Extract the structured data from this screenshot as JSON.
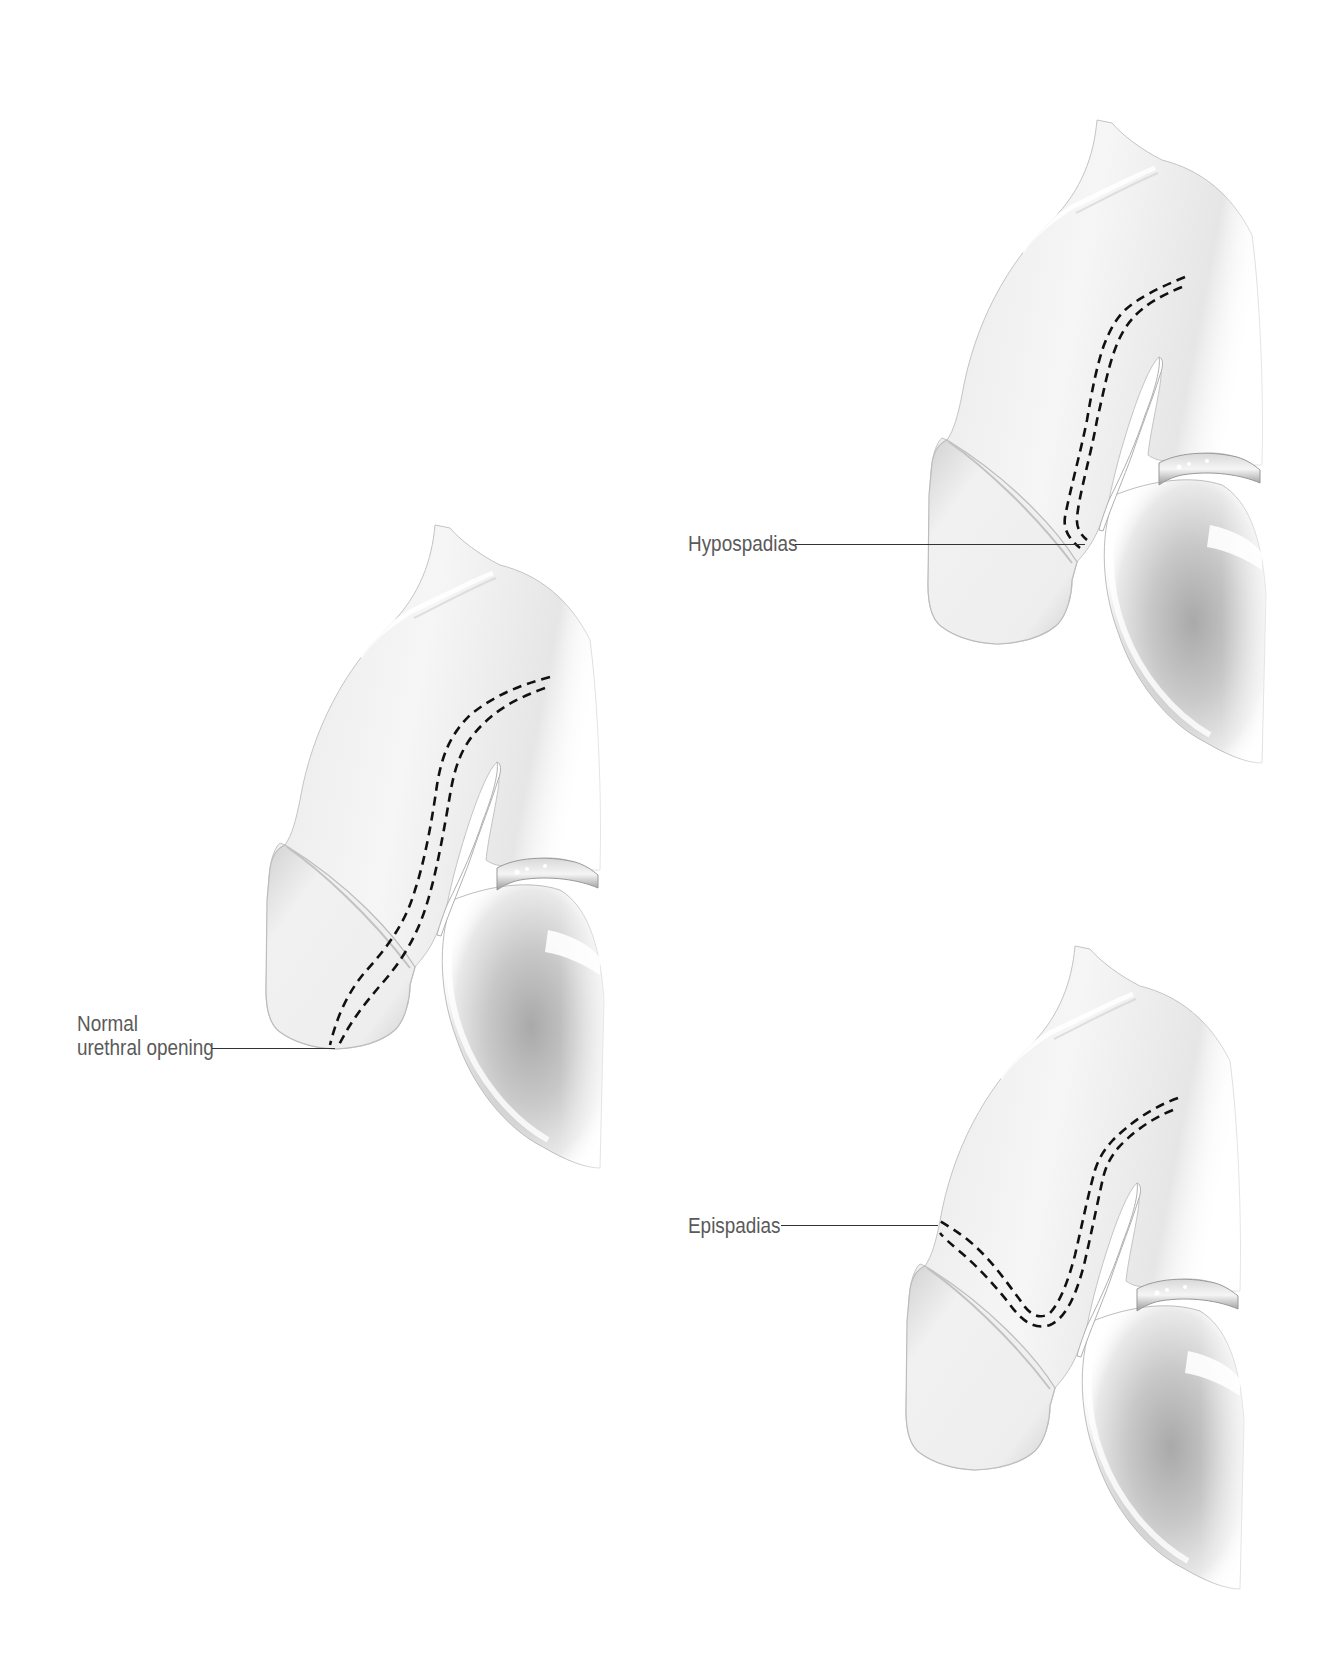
{
  "figure": {
    "type": "anatomical-illustration",
    "panels": [
      {
        "id": "normal",
        "label_lines": [
          "Normal",
          "urethral opening"
        ],
        "offset": [
          0,
          0
        ]
      },
      {
        "id": "hypospadias",
        "label_lines": [
          "Hypospadias"
        ],
        "offset": [
          662,
          -405
        ]
      },
      {
        "id": "epispadias",
        "label_lines": [
          "Epispadias"
        ],
        "offset": [
          640,
          421
        ]
      }
    ],
    "colors": {
      "background": "#ffffff",
      "body_light": "#f4f4f4",
      "body_shade": "#b8b8b8",
      "urethra_dash": "#111111",
      "label_text": "#5a5a5a",
      "leader_line": "#333333"
    }
  }
}
